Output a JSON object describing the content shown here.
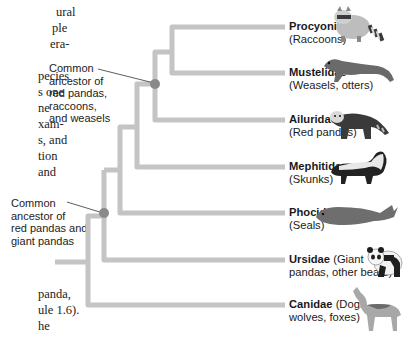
{
  "body_text_fragments": {
    "top": [
      "ural",
      "ple",
      "era-",
      "",
      "pecies",
      "s one",
      "ne",
      "xam-",
      "s, and",
      "tion",
      "and"
    ],
    "bottom": [
      "panda,",
      "ule 1.6).",
      "he"
    ]
  },
  "callouts": {
    "upper": "Common\nancestor of\nred pandas,\nraccoons,\nand weasels",
    "lower": "Common\nancestor of\nred pandas and\ngiant pandas"
  },
  "taxa": [
    {
      "family": "Procyonidae",
      "common_line1": "(Raccoons)",
      "common_inline": "",
      "animal": "raccoon"
    },
    {
      "family": "Mustelidae",
      "common_line1": "(Weasels, otters)",
      "common_inline": "",
      "animal": "weasel"
    },
    {
      "family": "Ailuridae",
      "common_line1": "(Red pandas)",
      "common_inline": "",
      "animal": "red-panda"
    },
    {
      "family": "Mephitidae",
      "common_line1": "(Skunks)",
      "common_inline": "",
      "animal": "skunk"
    },
    {
      "family": "Phocidae",
      "common_line1": "(Seals)",
      "common_inline": "",
      "animal": "seal"
    },
    {
      "family": "Ursidae",
      "common_inline": " (Giant",
      "common_line1": "pandas, other bears)",
      "animal": "giant-panda"
    },
    {
      "family": "Canidae",
      "common_inline": " (Dogs,",
      "common_line1": "wolves, foxes)",
      "animal": "wolf"
    }
  ],
  "colors": {
    "branch": "#c4c4c4",
    "node": "#8a8a8a",
    "leader": "#333333"
  }
}
